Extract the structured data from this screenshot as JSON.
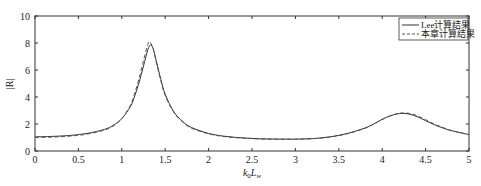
{
  "chart_data": {
    "type": "line",
    "title": "",
    "xlabel": "k0Lw",
    "xlabel_parts": {
      "k": "k",
      "sub0": "0",
      "L": "L",
      "subw": "w"
    },
    "ylabel": "|R|",
    "xlim": [
      0,
      5
    ],
    "ylim": [
      0,
      10
    ],
    "xticks": [
      0,
      0.5,
      1,
      1.5,
      2,
      2.5,
      3,
      3.5,
      4,
      4.5,
      5
    ],
    "xtick_labels": [
      "0",
      "0.5",
      "1",
      "1.5",
      "2",
      "2.5",
      "3",
      "3.5",
      "4",
      "4.5",
      "5"
    ],
    "yticks": [
      0,
      2,
      4,
      6,
      8,
      10
    ],
    "ytick_labels": [
      "0",
      "2",
      "4",
      "6",
      "8",
      "10"
    ],
    "grid": false,
    "legend_position": "upper right",
    "series": [
      {
        "name": "Lee计算结果",
        "style": "solid",
        "color": "#333333",
        "x": [
          0,
          0.2,
          0.4,
          0.6,
          0.8,
          0.9,
          1.0,
          1.1,
          1.15,
          1.2,
          1.25,
          1.3,
          1.33,
          1.36,
          1.4,
          1.45,
          1.5,
          1.6,
          1.7,
          1.8,
          2.0,
          2.2,
          2.4,
          2.6,
          2.8,
          3.0,
          3.2,
          3.4,
          3.6,
          3.8,
          3.9,
          4.0,
          4.1,
          4.2,
          4.3,
          4.4,
          4.5,
          4.6,
          4.7,
          4.8,
          5.0
        ],
        "y": [
          1.05,
          1.08,
          1.15,
          1.3,
          1.6,
          1.9,
          2.4,
          3.3,
          4.1,
          5.1,
          6.3,
          7.5,
          7.85,
          7.6,
          6.6,
          5.3,
          4.2,
          2.9,
          2.2,
          1.75,
          1.3,
          1.08,
          0.97,
          0.9,
          0.88,
          0.88,
          0.92,
          1.05,
          1.3,
          1.7,
          2.0,
          2.35,
          2.62,
          2.78,
          2.75,
          2.55,
          2.25,
          1.95,
          1.7,
          1.5,
          1.22
        ]
      },
      {
        "name": "本章计算结果",
        "style": "dashed",
        "color": "#555555",
        "x": [
          0,
          0.2,
          0.4,
          0.6,
          0.8,
          0.9,
          1.0,
          1.1,
          1.15,
          1.2,
          1.25,
          1.3,
          1.32,
          1.36,
          1.4,
          1.45,
          1.5,
          1.6,
          1.7,
          1.8,
          2.0,
          2.2,
          2.4,
          2.6,
          2.8,
          3.0,
          3.2,
          3.4,
          3.6,
          3.8,
          3.9,
          4.0,
          4.1,
          4.2,
          4.3,
          4.4,
          4.5,
          4.6,
          4.7,
          4.8,
          5.0
        ],
        "y": [
          1.0,
          1.03,
          1.1,
          1.25,
          1.55,
          1.85,
          2.4,
          3.4,
          4.3,
          5.4,
          6.7,
          7.9,
          8.1,
          7.6,
          6.5,
          5.2,
          4.1,
          2.85,
          2.15,
          1.7,
          1.27,
          1.05,
          0.95,
          0.89,
          0.87,
          0.87,
          0.91,
          1.03,
          1.28,
          1.68,
          1.98,
          2.33,
          2.62,
          2.8,
          2.8,
          2.62,
          2.32,
          2.0,
          1.74,
          1.52,
          1.2
        ]
      }
    ]
  }
}
